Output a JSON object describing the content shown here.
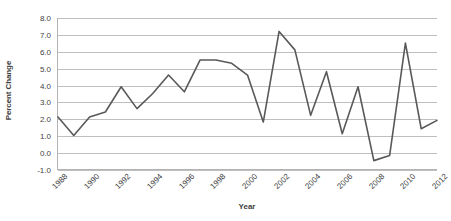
{
  "chart_data": {
    "type": "line",
    "title": "",
    "xlabel": "Year",
    "ylabel": "Percent Change",
    "ylim": [
      -1.0,
      8.0
    ],
    "xlim": [
      1988,
      2012
    ],
    "grid": true,
    "legend": false,
    "legend_position": "none",
    "line_color": "#595959",
    "x": [
      1988,
      1989,
      1990,
      1991,
      1992,
      1993,
      1994,
      1995,
      1996,
      1997,
      1998,
      1999,
      2000,
      2001,
      2002,
      2003,
      2004,
      2005,
      2006,
      2007,
      2008,
      2009,
      2010,
      2011,
      2012
    ],
    "values": [
      2.1,
      1.0,
      2.1,
      2.4,
      3.9,
      2.6,
      3.5,
      4.6,
      3.6,
      5.5,
      5.5,
      5.3,
      4.6,
      1.8,
      7.2,
      6.1,
      2.2,
      4.8,
      1.1,
      3.9,
      -0.5,
      -0.2,
      6.5,
      1.4,
      1.9
    ],
    "y_ticks": [
      8.0,
      7.0,
      6.0,
      5.0,
      4.0,
      3.0,
      2.0,
      1.0,
      0.0,
      -1.0
    ],
    "y_tick_labels": [
      "8.0",
      "7.0",
      "6.0",
      "5.0",
      "4.0",
      "3.0",
      "2.0",
      "1.0",
      "0.0",
      "-1.0"
    ],
    "x_ticks": [
      1988,
      1990,
      1992,
      1994,
      1996,
      1998,
      2000,
      2002,
      2004,
      2006,
      2008,
      2010,
      2012
    ],
    "x_tick_labels": [
      "1988",
      "1990",
      "1992",
      "1994",
      "1996",
      "1998",
      "2000",
      "2002",
      "2004",
      "2006",
      "2008",
      "2010",
      "2012"
    ],
    "series": [
      {
        "name": "Percent Change",
        "values": [
          2.1,
          1.0,
          2.1,
          2.4,
          3.9,
          2.6,
          3.5,
          4.6,
          3.6,
          5.5,
          5.5,
          5.3,
          4.6,
          1.8,
          7.2,
          6.1,
          2.2,
          4.8,
          1.1,
          3.9,
          -0.5,
          -0.2,
          6.5,
          1.4,
          1.9
        ]
      }
    ]
  }
}
